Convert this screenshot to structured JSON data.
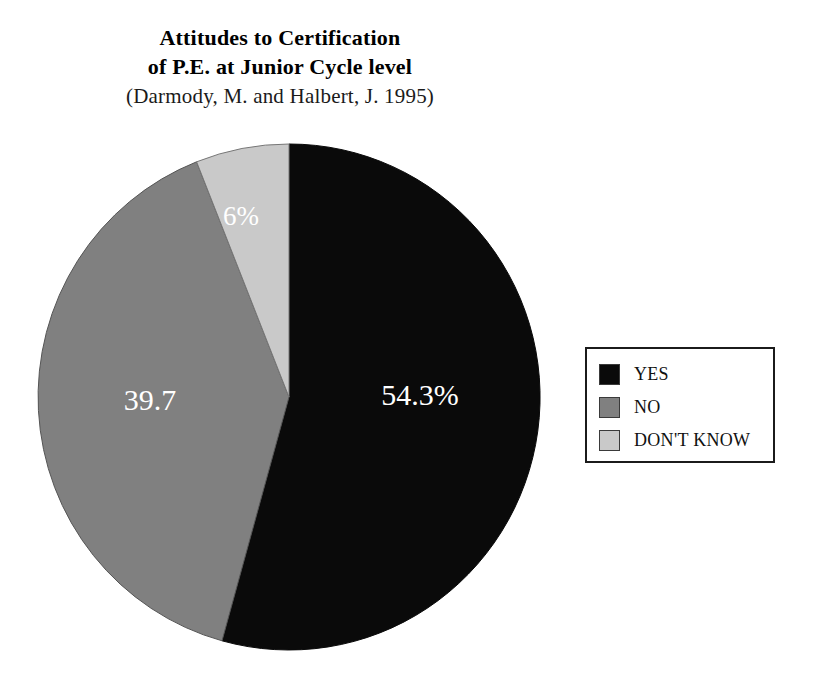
{
  "title": {
    "line1": "Attitudes to Certification",
    "line2": "of P.E. at Junior Cycle level",
    "source": "(Darmody, M. and Halbert, J. 1995)"
  },
  "legend": {
    "items": [
      {
        "label": "YES",
        "color": "#0a0a0a"
      },
      {
        "label": "NO",
        "color": "#808080"
      },
      {
        "label": "DON'T KNOW",
        "color": "#c9c9c9"
      }
    ]
  },
  "slice_labels": {
    "yes": "54.3%",
    "no": "39.7",
    "dont_know": "6%"
  },
  "chart_data": {
    "type": "pie",
    "title": "Attitudes to Certification of P.E. at Junior Cycle level",
    "subtitle": "(Darmody, M. and Halbert, J. 1995)",
    "categories": [
      "YES",
      "NO",
      "DON'T KNOW"
    ],
    "values": [
      54.3,
      39.7,
      6.0
    ],
    "value_labels": [
      "54.3%",
      "39.7",
      "6%"
    ],
    "colors": [
      "#0a0a0a",
      "#808080",
      "#c9c9c9"
    ],
    "units": "percent",
    "start_angle_deg": 0,
    "direction": "clockwise",
    "legend": "right",
    "grid": false,
    "xlabel": "",
    "ylabel": ""
  }
}
